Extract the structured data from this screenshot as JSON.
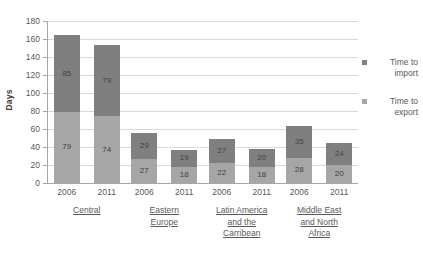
{
  "chart_data": {
    "type": "bar",
    "subtype": "stacked-bar",
    "title": "",
    "xlabel": "",
    "ylabel": "Days",
    "ylim": [
      0,
      180
    ],
    "ytick_step": 20,
    "yticks": [
      180,
      160,
      140,
      120,
      100,
      80,
      60,
      40,
      20,
      0
    ],
    "grid": true,
    "legend_position": "right",
    "stack_order": [
      "Time to export",
      "Time to import"
    ],
    "categories": [
      "Central 2006",
      "Central 2011",
      "Eastern Europe 2006",
      "Eastern Europe 2011",
      "Latin America and the Carribean 2006",
      "Latin America and the Carribean 2011",
      "Middle East and North Africa 2006",
      "Middle East and North Africa 2011"
    ],
    "series": [
      {
        "name": "Time to export",
        "color": "#a6a6a6",
        "values": [
          79,
          74,
          27,
          18,
          22,
          18,
          28,
          20
        ]
      },
      {
        "name": "Time to import",
        "color": "#7f7f7f",
        "values": [
          85,
          79,
          29,
          19,
          27,
          20,
          35,
          24
        ]
      }
    ],
    "totals": [
      164,
      153,
      56,
      37,
      49,
      38,
      63,
      44
    ],
    "groups": [
      {
        "label_lines": [
          "Central"
        ],
        "years": [
          "2006",
          "2011"
        ],
        "export": [
          79,
          74
        ],
        "import": [
          85,
          79
        ]
      },
      {
        "label_lines": [
          "Eastern",
          "Europe"
        ],
        "years": [
          "2006",
          "2011"
        ],
        "export": [
          27,
          18
        ],
        "import": [
          29,
          19
        ]
      },
      {
        "label_lines": [
          "Latin America",
          "and the",
          "Carribean"
        ],
        "years": [
          "2006",
          "2011"
        ],
        "export": [
          22,
          18
        ],
        "import": [
          27,
          20
        ]
      },
      {
        "label_lines": [
          "Middle East",
          "and North",
          "Africa"
        ],
        "years": [
          "2006",
          "2011"
        ],
        "export": [
          28,
          20
        ],
        "import": [
          35,
          24
        ]
      }
    ]
  },
  "axis": {
    "y_title": "Days",
    "y_labels": [
      "180",
      "160",
      "140",
      "120",
      "100",
      "80",
      "60",
      "40",
      "20",
      "0"
    ]
  },
  "legend": {
    "items": [
      {
        "label": "Time to import",
        "color": "#7f7f7f",
        "name": "time-to-import"
      },
      {
        "label": "Time to export",
        "color": "#a6a6a6",
        "name": "time-to-export"
      }
    ]
  },
  "colors": {
    "import": "#7f7f7f",
    "export": "#a6a6a6",
    "gridline": "#d9d9d9",
    "axis": "#a6a6a6",
    "text": "#595959",
    "background": "#ffffff"
  }
}
